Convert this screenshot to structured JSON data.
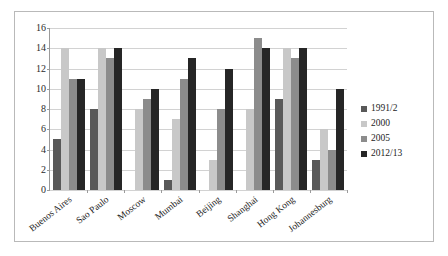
{
  "chart_data": {
    "type": "bar",
    "title": "",
    "subtitle": "",
    "xlabel": "",
    "ylabel": "",
    "ylim": [
      0,
      16
    ],
    "ytick_step": 2,
    "yticks": [
      0,
      2,
      4,
      6,
      8,
      10,
      12,
      14,
      16
    ],
    "grid": true,
    "legend_position": "right",
    "categories": [
      "Buenos Aires",
      "Sao Paulo",
      "Moscow",
      "Mumbai",
      "Beijing",
      "Shanghai",
      "Hong Kong",
      "Johannesburg"
    ],
    "series": [
      {
        "name": "1991/2",
        "color": "#595959",
        "values": [
          5,
          8,
          null,
          1,
          null,
          null,
          9,
          3
        ]
      },
      {
        "name": "2000",
        "color": "#c8c8c8",
        "values": [
          14,
          14,
          8,
          7,
          3,
          8,
          14,
          6
        ]
      },
      {
        "name": "2005",
        "color": "#8c8c8c",
        "values": [
          11,
          13,
          9,
          11,
          8,
          15,
          13,
          4
        ]
      },
      {
        "name": "2012/13",
        "color": "#262626",
        "values": [
          11,
          14,
          10,
          13,
          12,
          14,
          14,
          10
        ]
      }
    ]
  },
  "legend": {
    "items": [
      {
        "label": "1991/2",
        "color": "#595959"
      },
      {
        "label": "2000",
        "color": "#c8c8c8"
      },
      {
        "label": "2005",
        "color": "#8c8c8c"
      },
      {
        "label": "2012/13",
        "color": "#262626"
      }
    ]
  },
  "colors": {
    "frame_border": "#b9b9b9",
    "axis": "#9a9a9a",
    "gridline": "#d2d2d2",
    "background": "#ffffff",
    "text": "#1d1d1d"
  }
}
